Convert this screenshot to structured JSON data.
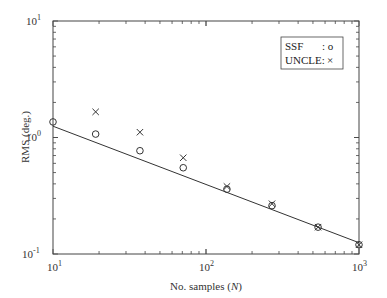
{
  "chart_data": {
    "type": "scatter",
    "title": "",
    "xlabel": "No. samples (N)",
    "ylabel": "RMS (deg.)",
    "xscale": "log",
    "yscale": "log",
    "xlim": [
      10,
      1000
    ],
    "ylim": [
      0.1,
      10
    ],
    "x_ticks": [
      "10^1",
      "10^2",
      "10^3"
    ],
    "y_ticks": [
      "10^-1",
      "10^0",
      "10^1"
    ],
    "grid": false,
    "legend_position": "upper right",
    "series": [
      {
        "name": "SSF",
        "marker": "o",
        "x": [
          10,
          19,
          37,
          71,
          137,
          270,
          540,
          1000
        ],
        "y": [
          1.36,
          1.07,
          0.77,
          0.55,
          0.36,
          0.26,
          0.17,
          0.12
        ]
      },
      {
        "name": "UNCLE",
        "marker": "x",
        "x": [
          19,
          37,
          71,
          137,
          270,
          540,
          1000
        ],
        "y": [
          1.66,
          1.11,
          0.67,
          0.38,
          0.27,
          0.17,
          0.12
        ]
      },
      {
        "name": "fit",
        "marker": "line",
        "x": [
          10,
          1000
        ],
        "y": [
          1.25,
          0.125
        ]
      }
    ]
  },
  "labels": {
    "xlabel_prefix": "No. samples (",
    "xlabel_var": "N",
    "xlabel_suffix": ")",
    "ylabel": "RMS (deg.)",
    "legend_ssf": "SSF",
    "legend_ssf_marker": ": o",
    "legend_uncle": "UNCLE:",
    "legend_uncle_marker": "×",
    "x_tick_base": "10",
    "x_tick_exps": [
      "1",
      "2",
      "3"
    ],
    "y_tick_base": "10",
    "y_tick_exps": [
      "-1",
      "0",
      "1"
    ]
  }
}
